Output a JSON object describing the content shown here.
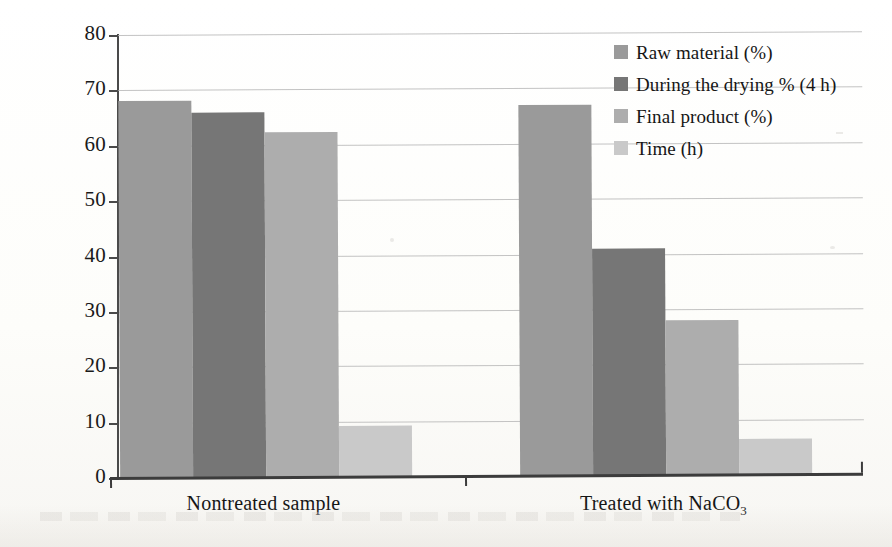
{
  "chart_data": {
    "type": "bar",
    "title": "",
    "xlabel": "",
    "ylabel": "",
    "ylim": [
      0,
      80
    ],
    "ytick_step": 10,
    "yticks": [
      "80",
      "70",
      "60",
      "50",
      "40",
      "30",
      "20",
      "10",
      "0"
    ],
    "grid": true,
    "legend_position": "top-right-inside",
    "categories": [
      "Nontreated sample",
      "Treated with NaCO3"
    ],
    "category_labels_html": [
      "Nontreated sample",
      "Treated with NaCO<sub>3</sub>"
    ],
    "series": [
      {
        "name": "Raw material (%)",
        "values": [
          68,
          67
        ],
        "color": "#9a9a9a"
      },
      {
        "name": "During the drying % (4 h)",
        "values": [
          66,
          41
        ],
        "color": "#767676"
      },
      {
        "name": "Final product (%)",
        "values": [
          62.3,
          28
        ],
        "color": "#adadad"
      },
      {
        "name": "Time (h)",
        "values": [
          9.3,
          6.5
        ],
        "color": "#c9c9c9"
      }
    ]
  },
  "legend": {
    "items": [
      {
        "label": "Raw material (%)",
        "color": "#9a9a9a"
      },
      {
        "label": "During the drying % (4 h)",
        "color": "#767676"
      },
      {
        "label": "Final product (%)",
        "color": "#adadad"
      },
      {
        "label": "Time (h)",
        "color": "#c9c9c9"
      }
    ]
  },
  "axis": {
    "y_labels": [
      "80",
      "70",
      "60",
      "50",
      "40",
      "30",
      "20",
      "10",
      "0"
    ],
    "x_labels": [
      "Nontreated sample",
      "Treated with NaCO3"
    ]
  },
  "colors": {
    "axis": "#3c3c3c",
    "grid": "#b9b9b9",
    "text": "#151515",
    "background": "#fdfdfb"
  }
}
